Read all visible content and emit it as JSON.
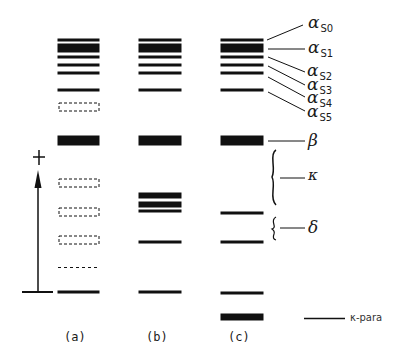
{
  "figure": {
    "type": "energy-level diagram",
    "columns": [
      {
        "id": "a",
        "label": "(a)"
      },
      {
        "id": "b",
        "label": "(b)"
      },
      {
        "id": "c",
        "label": "(c)"
      }
    ],
    "axis_marker": "+",
    "level_labels": [
      {
        "greek": "α",
        "sub": "S0"
      },
      {
        "greek": "α",
        "sub": "S1"
      },
      {
        "greek": "α",
        "sub": "S2"
      },
      {
        "greek": "α",
        "sub": "S3"
      },
      {
        "greek": "α",
        "sub": "S4"
      },
      {
        "greek": "α",
        "sub": "S5"
      },
      {
        "greek": "β",
        "sub": ""
      },
      {
        "greek": "κ",
        "sub": ""
      },
      {
        "greek": "δ",
        "sub": ""
      }
    ],
    "legend": {
      "label": "κ-para"
    },
    "colors": {
      "ink": "#111111",
      "background": "#ffffff"
    }
  }
}
